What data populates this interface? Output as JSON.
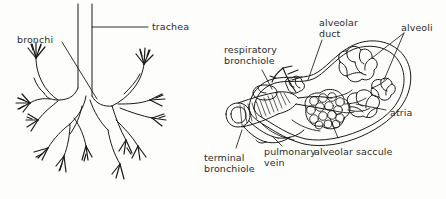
{
  "figure": {
    "background_color": "#fdfdfc",
    "ink_color": "#1a1a1a",
    "label_color": "#2b2b2b"
  },
  "panels": [
    {
      "id": "left-panel",
      "name": "bronchial-tree-diagram",
      "description": "trachea branching into left and right bronchi with terminal tufts"
    },
    {
      "id": "right-panel",
      "name": "acinus-diagram",
      "description": "respiratory bronchiole, alveolar ducts, saccules and alveoli"
    }
  ],
  "labels": {
    "trachea": "trachea",
    "bronchi": "bronchi",
    "respiratory_bronchiole": "respiratory\nbronchiole",
    "alveolar_duct": "alveolar\nduct",
    "alveoli": "alveoli",
    "atria": "atria",
    "terminal_bronchiole": "terminal\nbronchiole",
    "pulmonary_vein": "pulmonary\nvein",
    "alveolar_saccule": "alveolar saccule"
  }
}
